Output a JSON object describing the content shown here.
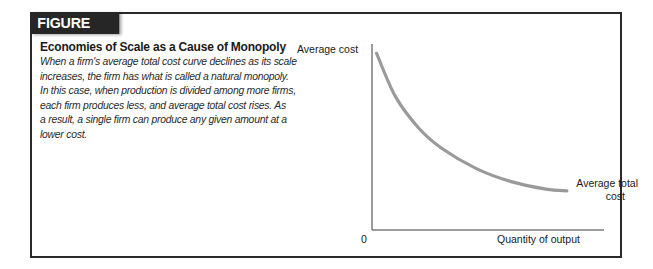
{
  "figure": {
    "number_label": "FIGURE 14.1",
    "title": "Economies of Scale as a Cause of Monopoly",
    "caption_lines": [
      "When a firm's average total cost curve declines as its scale",
      "increases, the firm has what is called a natural monopoly.",
      "In this case, when production is divided among more firms,",
      "each firm produces less, and average total cost rises. As",
      "a result, a single firm can produce any given amount at a",
      "lower cost."
    ]
  },
  "chart_data": {
    "type": "line",
    "title": "Economies of Scale as a Cause of Monopoly",
    "xlabel": "Quantity of output",
    "ylabel": "Average cost",
    "origin_label": "0",
    "grid": false,
    "legend": "none",
    "annotations": [
      {
        "text": "Average total cost",
        "position": "end of curve, right"
      }
    ],
    "series": [
      {
        "name": "Average total cost",
        "shape": "downward-sloping convex curve (declining at a decreasing rate)",
        "color": "#9a9a9a",
        "x": [
          0.02,
          0.1,
          0.2,
          0.3,
          0.45,
          0.6,
          0.75,
          0.84
        ],
        "y": [
          0.95,
          0.72,
          0.55,
          0.44,
          0.33,
          0.26,
          0.22,
          0.21
        ]
      }
    ],
    "xlim": [
      0,
      1
    ],
    "ylim": [
      0,
      1
    ]
  },
  "colors": {
    "frame": "#2a2a2a",
    "tab_bg": "#262626",
    "tab_text": "#ffffff",
    "curve": "#9a9a9a",
    "axis": "#3a3a3a"
  }
}
